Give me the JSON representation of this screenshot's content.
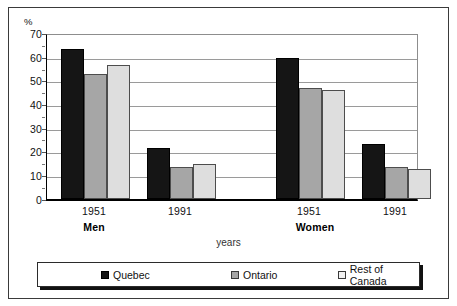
{
  "chart_data": {
    "type": "bar",
    "title": "",
    "xlabel": "years",
    "ylabel": "%",
    "ylim": [
      0,
      70
    ],
    "ytick_step": 10,
    "yticks": [
      "0",
      "10",
      "20",
      "30",
      "40",
      "50",
      "60",
      "70"
    ],
    "grid": true,
    "legend_position": "bottom",
    "groups": [
      {
        "sex": "Men",
        "year": "1951"
      },
      {
        "sex": "Men",
        "year": "1991"
      },
      {
        "sex": "Women",
        "year": "1951"
      },
      {
        "sex": "Women",
        "year": "1991"
      }
    ],
    "categories": [
      "1951",
      "1991",
      "1951",
      "1991"
    ],
    "sex_labels": [
      "Men",
      "Women"
    ],
    "series": [
      {
        "name": "Quebec",
        "color": "#151515",
        "values": [
          65,
          22,
          61,
          24
        ]
      },
      {
        "name": "Ontario",
        "color": "#a6a6a6",
        "values": [
          54,
          14,
          48,
          14
        ]
      },
      {
        "name": "Rest of Canada",
        "color": "#dedede",
        "values": [
          58,
          15,
          47,
          13
        ]
      }
    ]
  },
  "axes": {
    "y_unit_label": "%",
    "x_axis_title": "years",
    "y_tick_0": "0",
    "y_tick_10": "10",
    "y_tick_20": "20",
    "y_tick_30": "30",
    "y_tick_40": "40",
    "y_tick_50": "50",
    "y_tick_60": "60",
    "y_tick_70": "70"
  },
  "x_labels": {
    "men_1951": "1951",
    "men_1991": "1991",
    "women_1951": "1951",
    "women_1991": "1991",
    "men_group": "Men",
    "women_group": "Women"
  },
  "legend": {
    "items": [
      {
        "label": "Quebec",
        "color": "#151515"
      },
      {
        "label": "Ontario",
        "color": "#a6a6a6"
      },
      {
        "label": "Rest of Canada",
        "color": "#f2f2f2"
      }
    ]
  }
}
